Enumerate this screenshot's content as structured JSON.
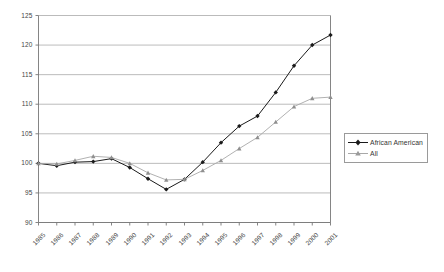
{
  "chart_data": {
    "type": "line",
    "title": "",
    "subtitle": "",
    "xlabel": "",
    "ylabel": "",
    "grid": true,
    "grid_axis": "y",
    "legend_position": "right",
    "ylim": [
      90,
      125
    ],
    "yticks": [
      90,
      95,
      100,
      105,
      110,
      115,
      120,
      125
    ],
    "ytick_labels": [
      "90",
      "95",
      "100",
      "105",
      "110",
      "115",
      "120",
      "125"
    ],
    "categories": [
      "1985",
      "1986",
      "1987",
      "1988",
      "1989",
      "1990",
      "1991",
      "1992",
      "1993",
      "1994",
      "1995",
      "1996",
      "1997",
      "1998",
      "1999",
      "2000",
      "2001"
    ],
    "x": [
      1985,
      1986,
      1987,
      1988,
      1989,
      1990,
      1991,
      1992,
      1993,
      1994,
      1995,
      1996,
      1997,
      1998,
      1999,
      2000,
      2001
    ],
    "series": [
      {
        "name": "African American",
        "color": "#1a1a1a",
        "marker": "diamond",
        "values": [
          100.0,
          99.6,
          100.2,
          100.3,
          100.8,
          99.3,
          97.4,
          95.6,
          97.3,
          100.2,
          103.5,
          106.3,
          108.0,
          112.0,
          116.5,
          120.0,
          121.7
        ]
      },
      {
        "name": "All",
        "color": "#a8a8a8",
        "marker": "triangle",
        "values": [
          100.0,
          99.9,
          100.5,
          101.2,
          101.0,
          100.0,
          98.4,
          97.2,
          97.3,
          98.8,
          100.5,
          102.5,
          104.4,
          107.0,
          109.6,
          111.0,
          111.2
        ]
      }
    ]
  },
  "legend": {
    "items": [
      {
        "label": "African American"
      },
      {
        "label": "All"
      }
    ]
  },
  "axes": {
    "y_axis_name": "value-axis",
    "x_axis_name": "year-axis"
  }
}
